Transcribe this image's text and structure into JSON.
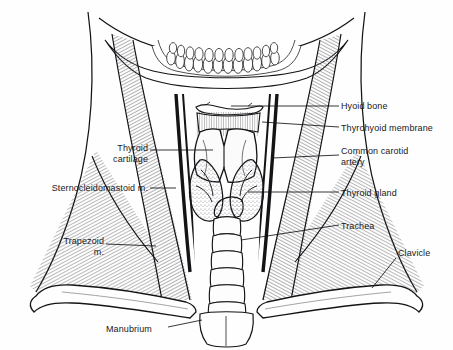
{
  "figure": {
    "type": "anatomical-line-drawing",
    "width": 453,
    "height": 350,
    "ink_color": "#141417",
    "background_color": "#fefefe",
    "stipple_color": "#8d8d93",
    "hatch_color": "#5b5b62"
  },
  "labels": [
    {
      "id": "hyoid-bone",
      "text": "Hyoid bone",
      "side": "right",
      "x": 341,
      "y": 101,
      "align": "left"
    },
    {
      "id": "thyrohyoid-membrane",
      "text": "Thyrohyoid membrane",
      "side": "right",
      "x": 341,
      "y": 123,
      "align": "left"
    },
    {
      "id": "common-carotid-artery",
      "text": "Common carotid\nartery",
      "side": "right",
      "x": 341,
      "y": 146,
      "align": "left"
    },
    {
      "id": "thyroid-gland",
      "text": "Thyroid gland",
      "side": "right",
      "x": 341,
      "y": 188,
      "align": "left"
    },
    {
      "id": "trachea",
      "text": "Trachea",
      "side": "right",
      "x": 341,
      "y": 221,
      "align": "left"
    },
    {
      "id": "clavicle",
      "text": "Clavicle",
      "side": "right",
      "x": 398,
      "y": 248,
      "align": "left"
    },
    {
      "id": "thyroid-cartilage",
      "text": "Thyroid\ncartilage",
      "side": "left",
      "x": 88,
      "y": 143,
      "align": "right",
      "w": 60
    },
    {
      "id": "sternocleidomastoid",
      "text": "Sternocleidomastoid m.",
      "side": "left",
      "x": 16,
      "y": 183,
      "align": "right",
      "w": 132
    },
    {
      "id": "trapezoid",
      "text": "Trapezoid\nm.",
      "side": "left",
      "x": 44,
      "y": 236,
      "align": "right",
      "w": 60
    },
    {
      "id": "manubrium",
      "text": "Manubrium",
      "side": "bottom",
      "x": 106,
      "y": 324,
      "align": "left"
    }
  ],
  "structures": [
    {
      "id": "mandible-teeth",
      "name": "Mandible with dental arch"
    },
    {
      "id": "hyoid-bone",
      "name": "Hyoid bone"
    },
    {
      "id": "thyrohyoid-membrane",
      "name": "Thyrohyoid membrane"
    },
    {
      "id": "thyroid-cartilage",
      "name": "Thyroid cartilage"
    },
    {
      "id": "thyroid-gland",
      "name": "Thyroid gland"
    },
    {
      "id": "trachea",
      "name": "Trachea",
      "ring_count": 7
    },
    {
      "id": "common-carotid-artery",
      "name": "Common carotid artery"
    },
    {
      "id": "sternocleidomastoid",
      "name": "Sternocleidomastoid muscle"
    },
    {
      "id": "trapezius",
      "name": "Trapezius muscle"
    },
    {
      "id": "clavicle",
      "name": "Clavicle"
    },
    {
      "id": "manubrium",
      "name": "Manubrium"
    }
  ]
}
